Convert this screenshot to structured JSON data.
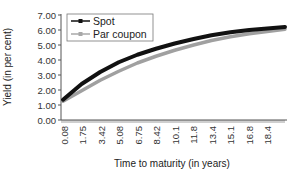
{
  "chart_data": {
    "type": "line",
    "title": "",
    "xlabel": "Time to maturity (in years)",
    "ylabel": "Yield (in per cent)",
    "ylim": [
      0,
      7
    ],
    "xlim": [
      0.08,
      20
    ],
    "y_ticks": [
      "0.00",
      "1.00",
      "2.00",
      "3.00",
      "4.00",
      "5.00",
      "6.00",
      "7.00"
    ],
    "x_tick_labels": [
      "0.08",
      "1.75",
      "3.42",
      "5.08",
      "6.75",
      "8.42",
      "10.1",
      "11.8",
      "13.4",
      "15.1",
      "16.8",
      "18.4"
    ],
    "grid": false,
    "legend_position": "upper left (inside)",
    "x": [
      0.08,
      1.75,
      3.42,
      5.08,
      6.75,
      8.42,
      10.1,
      11.8,
      13.4,
      15.1,
      16.8,
      18.4,
      20.0
    ],
    "series": [
      {
        "name": "Spot",
        "color": "#111111",
        "marker": "square",
        "values": [
          1.35,
          2.4,
          3.2,
          3.85,
          4.35,
          4.75,
          5.1,
          5.4,
          5.65,
          5.85,
          6.0,
          6.1,
          6.2
        ]
      },
      {
        "name": "Par coupon",
        "color": "#a0a0a0",
        "marker": "diamond",
        "values": [
          1.25,
          1.95,
          2.65,
          3.25,
          3.8,
          4.25,
          4.65,
          5.0,
          5.3,
          5.55,
          5.75,
          5.9,
          6.05
        ]
      }
    ]
  }
}
